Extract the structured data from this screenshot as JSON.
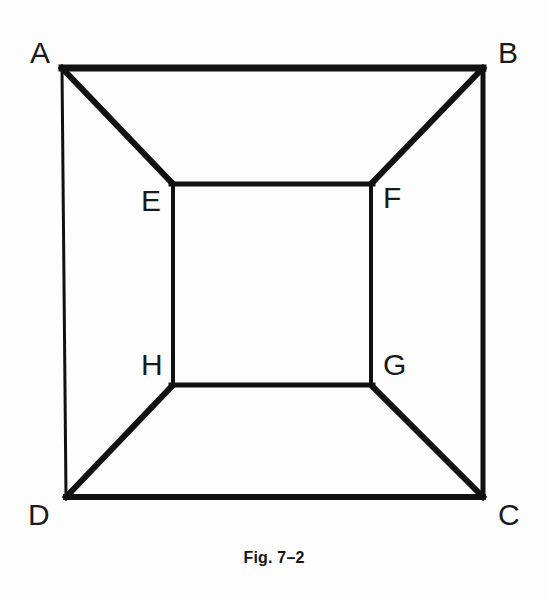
{
  "figure": {
    "caption": "Fig. 7–2",
    "background_color": "#fdfdfd",
    "stroke_color": "#111111",
    "label_color": "#1a1a1a",
    "width": 548,
    "height": 599
  },
  "labels": {
    "a": "A",
    "b": "B",
    "c": "C",
    "d": "D",
    "e": "E",
    "f": "F",
    "g": "G",
    "h": "H"
  },
  "chart_data": {
    "type": "diagram",
    "title": "Fig. 7–2",
    "points": [
      {
        "name": "A",
        "x": 62,
        "y": 68,
        "label_x": 30,
        "label_y": 38
      },
      {
        "name": "B",
        "x": 483,
        "y": 68,
        "label_x": 498,
        "label_y": 38
      },
      {
        "name": "C",
        "x": 483,
        "y": 497,
        "label_x": 498,
        "label_y": 500
      },
      {
        "name": "D",
        "x": 66,
        "y": 497,
        "label_x": 28,
        "label_y": 500
      },
      {
        "name": "E",
        "x": 173,
        "y": 184,
        "label_x": 141,
        "label_y": 186
      },
      {
        "name": "F",
        "x": 371,
        "y": 184,
        "label_x": 383,
        "label_y": 183
      },
      {
        "name": "G",
        "x": 371,
        "y": 385,
        "label_x": 383,
        "label_y": 350
      },
      {
        "name": "H",
        "x": 173,
        "y": 385,
        "label_x": 141,
        "label_y": 350
      }
    ],
    "edges": [
      {
        "name": "AB",
        "from": "A",
        "to": "B",
        "width": 7
      },
      {
        "name": "BC",
        "from": "B",
        "to": "C",
        "width": 5
      },
      {
        "name": "DC",
        "from": "D",
        "to": "C",
        "width": 6
      },
      {
        "name": "AD",
        "from": "A",
        "to": "D",
        "width": 3
      },
      {
        "name": "EF",
        "from": "E",
        "to": "F",
        "width": 5
      },
      {
        "name": "FG",
        "from": "F",
        "to": "G",
        "width": 4
      },
      {
        "name": "HG",
        "from": "H",
        "to": "G",
        "width": 5
      },
      {
        "name": "EH",
        "from": "E",
        "to": "H",
        "width": 4
      },
      {
        "name": "AE",
        "from": "A",
        "to": "E",
        "width": 6
      },
      {
        "name": "BF",
        "from": "B",
        "to": "F",
        "width": 6
      },
      {
        "name": "CG",
        "from": "C",
        "to": "G",
        "width": 6
      },
      {
        "name": "DH",
        "from": "D",
        "to": "H",
        "width": 6
      }
    ]
  }
}
